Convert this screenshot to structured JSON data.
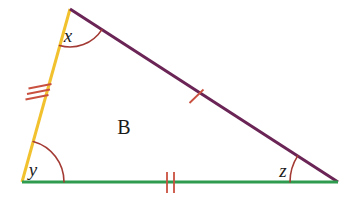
{
  "figure": {
    "name": "labelled-triangle",
    "background_color": "#FFFFFF",
    "width": 348,
    "height": 202,
    "region_label": "B"
  },
  "vertices": {
    "top": {
      "name": "apex",
      "x": 70,
      "y": 9
    },
    "bottom_left": {
      "name": "bottom-left",
      "x": 22,
      "y": 182
    },
    "bottom_right": {
      "name": "bottom-right",
      "x": 338,
      "y": 182
    }
  },
  "sides": [
    {
      "name": "left-side",
      "color": "#F2C12E",
      "stroke_width": 3,
      "tick_count": 3,
      "tick_label": "triple-tick",
      "from": "top",
      "to": "bottom_left"
    },
    {
      "name": "hypotenuse",
      "color": "#6A2455",
      "stroke_width": 3,
      "tick_count": 1,
      "tick_label": "single-tick",
      "from": "top",
      "to": "bottom_right"
    },
    {
      "name": "base",
      "color": "#2E9B4E",
      "stroke_width": 3,
      "tick_count": 2,
      "tick_label": "double-tick",
      "from": "bottom_left",
      "to": "bottom_right"
    }
  ],
  "tick_color": "#C9503F",
  "angles": [
    {
      "name": "angle-x",
      "label": "x",
      "vertex": "top",
      "arc_color": "#A33A33",
      "arc_radius": 38,
      "label_x": 68,
      "label_y": 42
    },
    {
      "name": "angle-y",
      "label": "y",
      "vertex": "bottom_left",
      "arc_color": "#A33A33",
      "arc_radius": 42,
      "label_x": 33,
      "label_y": 176
    },
    {
      "name": "angle-z",
      "label": "z",
      "vertex": "bottom_right",
      "arc_color": "#A33A33",
      "arc_radius": 48,
      "label_x": 283,
      "label_y": 177
    }
  ],
  "region": {
    "name": "interior-label",
    "label": "B",
    "x": 124,
    "y": 134
  }
}
